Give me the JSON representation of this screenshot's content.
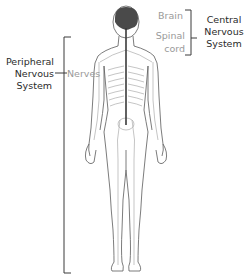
{
  "diagram": {
    "central": {
      "group_label": [
        "Central",
        "Nervous",
        "System"
      ],
      "parts": [
        {
          "label": "Brain"
        },
        {
          "label": "Spinal",
          "label2": "cord"
        }
      ]
    },
    "peripheral": {
      "group_label": [
        "Peripheral",
        "Nervous",
        "System"
      ],
      "parts": [
        {
          "label": "Nerves"
        }
      ]
    },
    "colors": {
      "text_dark": "#2a2a2a",
      "text_grey": "#9a9a9a",
      "bracket": "#3a3a3a",
      "brain_fill": "#4a4a4a",
      "outline": "#555555"
    }
  }
}
